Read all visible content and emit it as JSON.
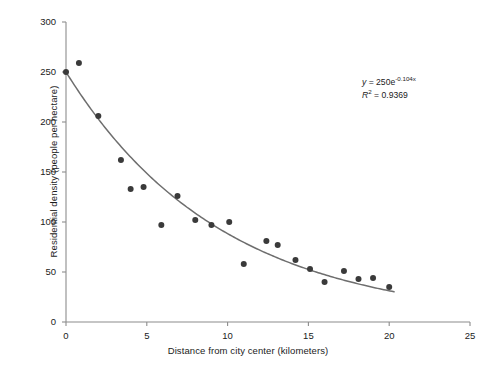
{
  "chart_data": {
    "type": "scatter",
    "title": "",
    "xlabel": "Distance from city center (kilometers)",
    "ylabel": "Residential density (people per hectare)",
    "xlim": [
      0,
      25
    ],
    "ylim": [
      0,
      300
    ],
    "xticks": [
      0,
      5,
      10,
      15,
      20,
      25
    ],
    "yticks": [
      0,
      50,
      100,
      150,
      200,
      250,
      300
    ],
    "xtick_labels": [
      "0",
      "5",
      "10",
      "15",
      "20",
      "25"
    ],
    "ytick_labels": [
      "0",
      "50",
      "100",
      "150",
      "200",
      "250",
      "300"
    ],
    "grid": false,
    "legend": "none",
    "points": [
      {
        "x": 0.0,
        "y": 250
      },
      {
        "x": 0.8,
        "y": 259
      },
      {
        "x": 2.0,
        "y": 206
      },
      {
        "x": 3.4,
        "y": 162
      },
      {
        "x": 4.0,
        "y": 133
      },
      {
        "x": 4.8,
        "y": 135
      },
      {
        "x": 5.9,
        "y": 97
      },
      {
        "x": 6.9,
        "y": 126
      },
      {
        "x": 8.0,
        "y": 102
      },
      {
        "x": 9.0,
        "y": 97
      },
      {
        "x": 10.1,
        "y": 100
      },
      {
        "x": 11.0,
        "y": 58
      },
      {
        "x": 12.4,
        "y": 81
      },
      {
        "x": 13.1,
        "y": 77
      },
      {
        "x": 14.2,
        "y": 62
      },
      {
        "x": 15.1,
        "y": 53
      },
      {
        "x": 16.0,
        "y": 40
      },
      {
        "x": 17.2,
        "y": 51
      },
      {
        "x": 18.1,
        "y": 43
      },
      {
        "x": 19.0,
        "y": 44
      },
      {
        "x": 20.0,
        "y": 35
      }
    ],
    "fit_curve": {
      "form": "exponential",
      "a": 250,
      "b": -0.104,
      "x_start": 0,
      "x_end": 20.3
    },
    "annotation": {
      "equation_prefix": "y",
      "equation_body": " = 250e",
      "equation_exponent": "-0.104x",
      "r2_prefix": "R",
      "r2_superscript": "2",
      "r2_value": " = 0.9369"
    },
    "colors": {
      "point": "#3a3a3a",
      "curve": "#6e6e6e",
      "axis": "#8c8c8c",
      "text": "#1b1b1b",
      "background": "#ffffff"
    }
  }
}
